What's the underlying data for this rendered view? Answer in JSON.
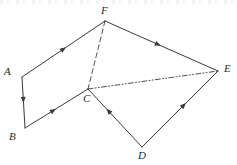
{
  "figure": {
    "type": "geometry-diagram",
    "background_color": "#ffffff",
    "stroke_color": "#3a3a3a",
    "label_color": "#2b2b2b",
    "width": 237,
    "height": 165,
    "vertices": [
      {
        "id": "A",
        "label": "A",
        "x": 22,
        "y": 77,
        "label_x": 4,
        "label_y": 66
      },
      {
        "id": "B",
        "label": "B",
        "x": 25,
        "y": 128,
        "label_x": 9,
        "label_y": 131
      },
      {
        "id": "C",
        "label": "C",
        "x": 88,
        "y": 89,
        "label_x": 83,
        "label_y": 93
      },
      {
        "id": "D",
        "label": "D",
        "x": 142,
        "y": 147,
        "label_x": 138,
        "label_y": 150
      },
      {
        "id": "E",
        "label": "E",
        "x": 218,
        "y": 71,
        "label_x": 224,
        "label_y": 63
      },
      {
        "id": "F",
        "label": "F",
        "x": 105,
        "y": 21,
        "label_x": 101,
        "label_y": 5
      }
    ],
    "edges": [
      {
        "id": "AF",
        "from": "A",
        "to": "F",
        "style": "solid",
        "arrow": "toward-F",
        "arrow_position": 0.5
      },
      {
        "id": "FE",
        "from": "F",
        "to": "E",
        "style": "solid",
        "arrow": "toward-E",
        "arrow_position": 0.47
      },
      {
        "id": "AB",
        "from": "A",
        "to": "B",
        "style": "solid",
        "arrow": "toward-B",
        "arrow_position": 0.45
      },
      {
        "id": "BC",
        "from": "B",
        "to": "C",
        "style": "solid",
        "arrow": "toward-C",
        "arrow_position": 0.45
      },
      {
        "id": "DC",
        "from": "D",
        "to": "C",
        "style": "solid",
        "arrow": "toward-C",
        "arrow_position": 0.62
      },
      {
        "id": "DE",
        "from": "D",
        "to": "E",
        "style": "solid",
        "arrow": "toward-E",
        "arrow_position": 0.55
      },
      {
        "id": "FC",
        "from": "F",
        "to": "C",
        "style": "dashed",
        "arrow": "none",
        "arrow_position": 0
      },
      {
        "id": "CE",
        "from": "C",
        "to": "E",
        "style": "dash-dot-dot",
        "arrow": "none",
        "arrow_position": 0
      }
    ]
  }
}
